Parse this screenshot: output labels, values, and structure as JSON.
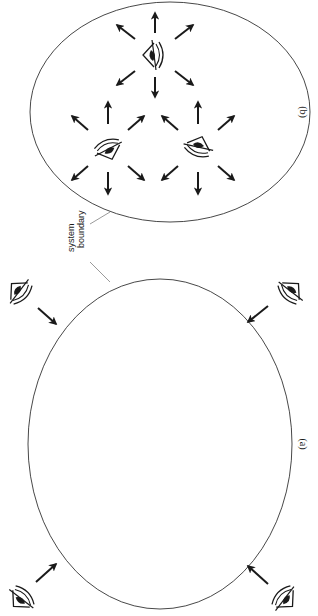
{
  "diagram": {
    "orientation": "rotated 90 degrees clockwise",
    "annotation": {
      "line1": "system",
      "line2": "boundary"
    },
    "panels": [
      {
        "id": "a",
        "label": "(a)",
        "description": "Observers outside the system boundary looking in",
        "observers_outside": 4,
        "observers_inside": 0
      },
      {
        "id": "b",
        "label": "(b)",
        "description": "Observers inside the system boundary looking out in all directions",
        "observers_outside": 0,
        "observers_inside": 3,
        "arrows_per_observer": 8
      }
    ],
    "colors": {
      "stroke": "#1a1a1a",
      "circle": "#333333",
      "background": "#ffffff"
    }
  }
}
